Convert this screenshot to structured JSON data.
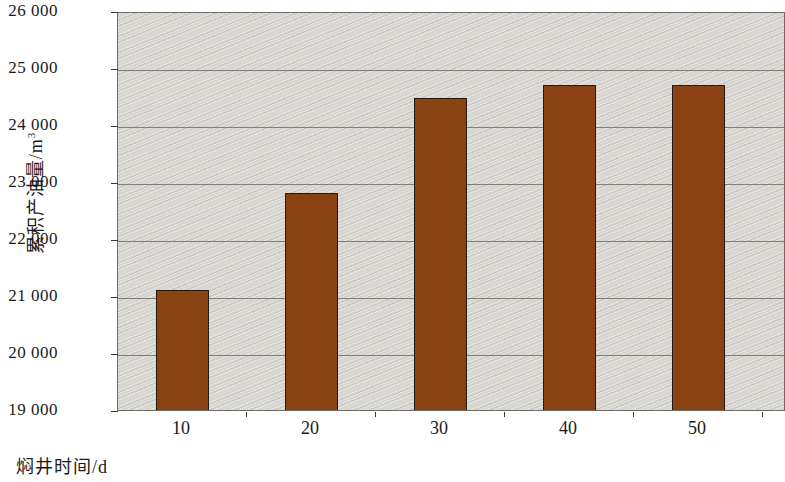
{
  "chart_data": {
    "type": "bar",
    "title": "",
    "subtitle": "",
    "xlabel": "焖井时间/d",
    "ylabel": "累积产油量/m³",
    "ylabel_text": "累积产油量/m",
    "ylabel_exponent": "3",
    "categories": [
      "10",
      "20",
      "30",
      "40",
      "50"
    ],
    "values": [
      21100,
      22800,
      24480,
      24700,
      24700
    ],
    "series": [
      {
        "name": "累积产油量",
        "values": [
          21100,
          22800,
          24480,
          24700,
          24700
        ]
      }
    ],
    "ylim": [
      19000,
      26000
    ],
    "ytick_step": 1000,
    "ytick_labels": [
      "26 000",
      "25 000",
      "24 000",
      "23 000",
      "22 000",
      "21 000",
      "20 000",
      "19 000"
    ],
    "ytick_values": [
      26000,
      25000,
      24000,
      23000,
      22000,
      21000,
      20000,
      19000
    ],
    "xtick_labels": [
      "10",
      "20",
      "30",
      "40",
      "50"
    ],
    "grid": "horizontal",
    "legend": null,
    "legend_position": "none",
    "colors": {
      "bar_fill": "#8A4215",
      "bar_outline": "#231a12",
      "plot_background": "#d6d4ce",
      "gridline": "#6f6d68",
      "axis": "#3a3833",
      "text": "#1a1a1a",
      "figure_background": "#ffffff"
    },
    "note": "右侧柱子被截断 (rightmost bar cropped by image edge)"
  }
}
